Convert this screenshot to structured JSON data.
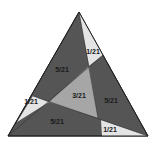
{
  "colors": {
    "background": "#ffffff",
    "outer_stroke": "#222222",
    "dark_region": "#555555",
    "inner_triangle": "#a6a6a6",
    "corner_triangle": "#e4e4e4"
  },
  "outer_triangle": {
    "vertices": [
      [
        79,
        12
      ],
      [
        148,
        136
      ],
      [
        8,
        136
      ]
    ]
  },
  "inner_triangle": {
    "vertices": [
      [
        89,
        66
      ],
      [
        98,
        118
      ],
      [
        49,
        102
      ]
    ],
    "label": "3/21"
  },
  "regions": [
    {
      "name": "upper-left-quadrilateral",
      "label": "5/21"
    },
    {
      "name": "right-quadrilateral",
      "label": "5/21"
    },
    {
      "name": "bottom-quadrilateral",
      "label": "5/21"
    },
    {
      "name": "top-corner-triangle",
      "label": "1/21"
    },
    {
      "name": "left-corner-triangle",
      "label": "1/21"
    },
    {
      "name": "bottom-right-corner-triangle",
      "label": "1/21"
    }
  ]
}
